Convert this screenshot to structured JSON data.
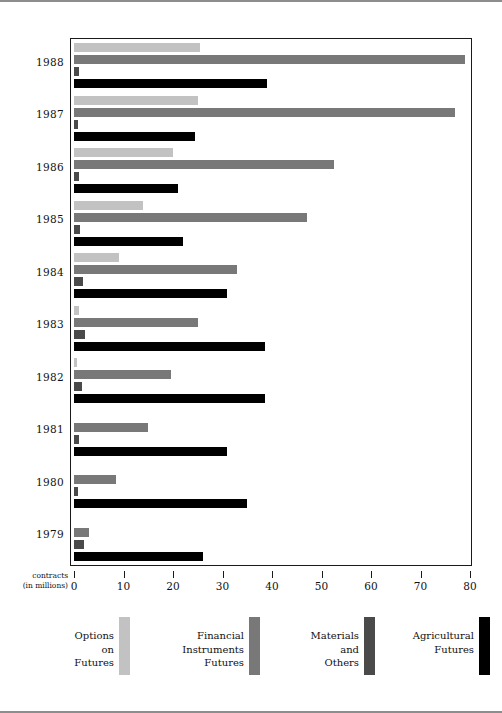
{
  "chart_data": {
    "type": "bar",
    "orientation": "horizontal",
    "title": "",
    "subtitle": "",
    "xlabel": "contracts (in millions)",
    "ylabel": "",
    "xlim": [
      0,
      80
    ],
    "xticks": [
      0,
      10,
      20,
      30,
      40,
      50,
      60,
      70,
      80
    ],
    "xtick_labels": [
      "0",
      "10",
      "20",
      "30",
      "40",
      "50",
      "60",
      "70",
      "80"
    ],
    "grid": false,
    "legend_position": "bottom",
    "categories": [
      "1988",
      "1987",
      "1986",
      "1985",
      "1984",
      "1983",
      "1982",
      "1981",
      "1980",
      "1979"
    ],
    "series": [
      {
        "name": "Options on Futures",
        "color": "#c2c2c2",
        "values": [
          25.5,
          25.0,
          20.0,
          14.0,
          9.0,
          1.0,
          0.6,
          0.0,
          0.0,
          0.0
        ]
      },
      {
        "name": "Financial Instruments Futures",
        "color": "#787878",
        "values": [
          79.0,
          77.0,
          52.5,
          47.0,
          33.0,
          25.0,
          19.5,
          15.0,
          8.5,
          3.0
        ]
      },
      {
        "name": "Materials and Others",
        "color": "#4a4a4a",
        "values": [
          1.0,
          0.8,
          1.0,
          1.2,
          1.8,
          2.2,
          1.6,
          1.0,
          0.9,
          2.0
        ]
      },
      {
        "name": "Agricultural Futures",
        "color": "#000000",
        "values": [
          39.0,
          24.5,
          21.0,
          22.0,
          31.0,
          38.5,
          38.5,
          31.0,
          35.0,
          26.0
        ]
      }
    ]
  },
  "axis": {
    "caption_line1": "contracts",
    "caption_line2": "(in millions)"
  },
  "legend": {
    "items": [
      {
        "label_lines": [
          "Options",
          "on",
          "Futures"
        ],
        "color": "#c2c2c2"
      },
      {
        "label_lines": [
          "Financial",
          "Instruments",
          "Futures"
        ],
        "color": "#787878"
      },
      {
        "label_lines": [
          "Materials",
          "and",
          "Others"
        ],
        "color": "#4a4a4a"
      },
      {
        "label_lines": [
          "Agricultural",
          "Futures"
        ],
        "color": "#000000"
      }
    ]
  }
}
